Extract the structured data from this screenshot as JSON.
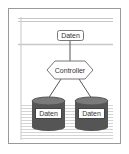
{
  "diagram": {
    "top_box": {
      "label": "Daten"
    },
    "controller": {
      "label": "Controller"
    },
    "stores": [
      {
        "label": "Daten"
      },
      {
        "label": "Daten"
      }
    ],
    "colors": {
      "frame": "#9a9a9a",
      "line": "#555555",
      "cylinder": "#555555",
      "cylinder_top": "#7a7a7a",
      "stripe": "#cfcfcf"
    }
  }
}
